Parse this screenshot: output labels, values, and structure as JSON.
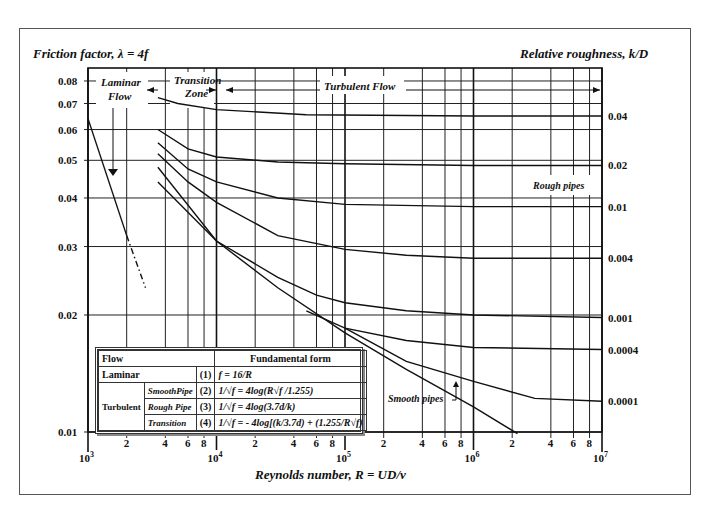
{
  "header": {
    "y_title": "Friction factor, λ = 4f",
    "right_title": "Relative roughness, k/D",
    "x_title": "Reynolds number, R = UD/ν"
  },
  "zones": {
    "laminar": [
      "Laminar",
      "Flow"
    ],
    "transition": [
      "Transition",
      "Zone"
    ],
    "turbulent": "Turbulent Flow",
    "rough": "Rough pipes",
    "smooth": "Smooth pipes"
  },
  "table": {
    "header": [
      "Flow",
      "Fundamental form"
    ],
    "laminar": {
      "label": "Laminar",
      "num": "(1)",
      "formula": "f = 16/R"
    },
    "turbulent_label": "Turbulent",
    "rows": [
      {
        "sub": "SmoothPipe",
        "num": "(2)",
        "formula": "1/√f = 4log(R√f /1.255)"
      },
      {
        "sub": "Rough Pipe",
        "num": "(3)",
        "formula": "1/√f = 4log(3.7d/k)"
      },
      {
        "sub": "Transition",
        "num": "(4)",
        "formula": "1/√f = - 4log[(k/3.7d) + (1.255/R√f)"
      }
    ]
  },
  "chart_data": {
    "type": "line",
    "xlabel": "Reynolds number, R = UD/ν",
    "ylabel": "Friction factor, λ = 4f",
    "right_label": "Relative roughness, k/D",
    "xscale": "log",
    "yscale": "log",
    "xlim": [
      1000,
      10000000
    ],
    "ylim": [
      0.01,
      0.08
    ],
    "y_ticks": [
      0.08,
      0.07,
      0.06,
      0.05,
      0.04,
      0.03,
      0.02,
      0.01
    ],
    "y_tick_labels": [
      "0.08",
      "0.07",
      "0.06",
      "0.05",
      "0.04",
      "0.03",
      "0.02",
      "0.01"
    ],
    "x_minor_tick_labels": [
      "2",
      "4",
      "6",
      "8"
    ],
    "x_decades": [
      3,
      4,
      5,
      6,
      7
    ],
    "grid": true,
    "series": [
      {
        "name": "Laminar",
        "style": "solid",
        "points": [
          [
            1000,
            0.064
          ],
          [
            2000,
            0.032
          ]
        ]
      },
      {
        "name": "Laminar (extension)",
        "style": "dashdot",
        "points": [
          [
            2000,
            0.032
          ],
          [
            2800,
            0.0235
          ]
        ]
      },
      {
        "name": "k/D = 0.04",
        "label": "0.04",
        "points": [
          [
            3500,
            0.0725
          ],
          [
            5000,
            0.07
          ],
          [
            10000,
            0.0675
          ],
          [
            50000,
            0.0655
          ],
          [
            1000000,
            0.065
          ],
          [
            10000000,
            0.065
          ]
        ]
      },
      {
        "name": "k/D = 0.02",
        "label": "0.02",
        "points": [
          [
            3500,
            0.06
          ],
          [
            6000,
            0.0535
          ],
          [
            10000,
            0.051
          ],
          [
            30000,
            0.0495
          ],
          [
            100000,
            0.049
          ],
          [
            1000000,
            0.0485
          ],
          [
            10000000,
            0.0485
          ]
        ]
      },
      {
        "name": "k/D = 0.01",
        "label": "0.01",
        "points": [
          [
            3500,
            0.0555
          ],
          [
            6000,
            0.0475
          ],
          [
            10000,
            0.044
          ],
          [
            30000,
            0.04
          ],
          [
            100000,
            0.0385
          ],
          [
            1000000,
            0.038
          ],
          [
            10000000,
            0.038
          ]
        ]
      },
      {
        "name": "k/D = 0.004",
        "label": "0.004",
        "points": [
          [
            3500,
            0.052
          ],
          [
            6000,
            0.044
          ],
          [
            10000,
            0.039
          ],
          [
            30000,
            0.032
          ],
          [
            100000,
            0.0295
          ],
          [
            300000,
            0.0285
          ],
          [
            1000000,
            0.028
          ],
          [
            10000000,
            0.028
          ]
        ]
      },
      {
        "name": "k/D = 0.001",
        "label": "0.001",
        "points": [
          [
            3500,
            0.048
          ],
          [
            10000,
            0.031
          ],
          [
            30000,
            0.025
          ],
          [
            60000,
            0.0225
          ],
          [
            100000,
            0.0215
          ],
          [
            300000,
            0.0205
          ],
          [
            1000000,
            0.02
          ],
          [
            10000000,
            0.0197
          ]
        ]
      },
      {
        "name": "k/D = 0.0004",
        "label": "0.0004",
        "points": [
          [
            50000,
            0.0205
          ],
          [
            100000,
            0.0185
          ],
          [
            300000,
            0.0172
          ],
          [
            1000000,
            0.0165
          ],
          [
            10000000,
            0.0163
          ]
        ]
      },
      {
        "name": "k/D = 0.0001",
        "label": "0.0001",
        "points": [
          [
            100000,
            0.0185
          ],
          [
            300000,
            0.0152
          ],
          [
            1000000,
            0.0135
          ],
          [
            3000000,
            0.0122
          ],
          [
            10000000,
            0.012
          ]
        ]
      },
      {
        "name": "Smooth pipes",
        "points": [
          [
            3500,
            0.044
          ],
          [
            10000,
            0.031
          ],
          [
            30000,
            0.0235
          ],
          [
            100000,
            0.018
          ],
          [
            300000,
            0.0145
          ],
          [
            1000000,
            0.0116
          ],
          [
            2200000,
            0.0099
          ]
        ]
      }
    ]
  }
}
